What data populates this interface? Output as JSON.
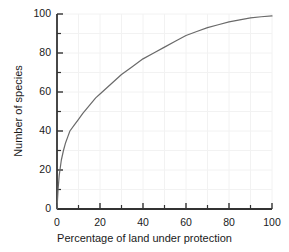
{
  "chart_data": {
    "type": "line",
    "title": "",
    "xlabel": "Percentage of land under protection",
    "ylabel": "Number of species",
    "xlim": [
      0,
      100
    ],
    "ylim": [
      0,
      100
    ],
    "xticks": [
      0,
      20,
      40,
      60,
      80,
      100
    ],
    "yticks": [
      0,
      20,
      40,
      60,
      80,
      100
    ],
    "xminor_step": 10,
    "yminor_step": 10,
    "grid": true,
    "grid_color": "#f2f2f2",
    "legend": null,
    "series": [
      {
        "name": "species accumulation",
        "color": "#6a6a6a",
        "linewidth": 1.2,
        "x": [
          0,
          0.5,
          1,
          2,
          3,
          4,
          5,
          6,
          8,
          10,
          12,
          15,
          18,
          20,
          25,
          30,
          35,
          40,
          45,
          50,
          55,
          60,
          65,
          70,
          75,
          80,
          85,
          90,
          95,
          100
        ],
        "y": [
          0,
          10,
          17,
          25,
          30,
          34,
          37,
          40,
          43,
          46,
          49,
          53,
          57,
          59,
          64,
          69,
          73,
          77,
          80,
          83,
          86,
          89,
          91,
          93,
          94.5,
          96,
          97,
          98,
          98.6,
          99
        ]
      }
    ]
  },
  "axes": {
    "x_tick_labels": [
      "0",
      "20",
      "40",
      "60",
      "80",
      "100"
    ],
    "y_tick_labels": [
      "0",
      "20",
      "40",
      "60",
      "80",
      "100"
    ],
    "x_axis_title": "Percentage of land under protection",
    "y_axis_title": "Number of species"
  },
  "style": {
    "background": "#ffffff",
    "axis_color": "#333333",
    "curve_color": "#6a6a6a",
    "gridline_color": "#f2f2f2",
    "text_color": "#1a1a1a"
  }
}
